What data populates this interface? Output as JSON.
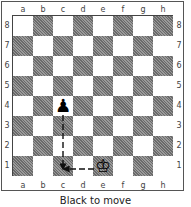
{
  "diagram": {
    "files": [
      "a",
      "b",
      "c",
      "d",
      "e",
      "f",
      "g",
      "h"
    ],
    "ranks": [
      "8",
      "7",
      "6",
      "5",
      "4",
      "3",
      "2",
      "1"
    ],
    "pieces": [
      {
        "square": "c4",
        "color": "black",
        "type": "pawn",
        "glyph": "♟"
      },
      {
        "square": "e1",
        "color": "white",
        "type": "king",
        "glyph": "♔"
      }
    ],
    "arrows": [
      {
        "from": "c4",
        "to": "c1",
        "style": "dashed"
      },
      {
        "from": "e1",
        "to": "c1",
        "style": "dashed"
      }
    ],
    "caption": "Black to move"
  }
}
